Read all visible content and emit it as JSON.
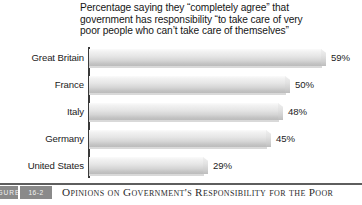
{
  "figure": {
    "tag_word": "FIGURE",
    "tag_number": "16-2",
    "caption": "Opinions on Government's Responsibility for the Poor"
  },
  "chart_data": {
    "type": "bar",
    "orientation": "horizontal",
    "title": "Percentage saying they “completely agree” that\ngovernment has responsibility “to take care of very\npoor people who can’t take care of themselves”",
    "xlabel": "",
    "ylabel": "",
    "grid": false,
    "legend": false,
    "xlim": [
      0,
      65
    ],
    "categories": [
      "Great Britain",
      "France",
      "Italy",
      "Germany",
      "United States"
    ],
    "values": [
      59,
      50,
      48,
      45,
      29
    ],
    "value_labels": [
      "59%",
      "50%",
      "48%",
      "45%",
      "29%"
    ],
    "series": [
      {
        "name": "Completely agree",
        "values": [
          59,
          50,
          48,
          45,
          29
        ]
      }
    ],
    "bar_fill_top": "#fbfbfb",
    "bar_fill_bottom": "#bcbcbc",
    "axis_color": "#3a3a3a"
  }
}
